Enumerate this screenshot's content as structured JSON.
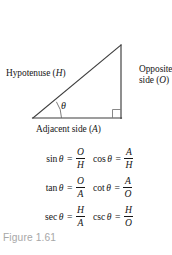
{
  "figure": {
    "caption": "Figure 1.61",
    "caption_color": "#a7a7a7",
    "background_color": "#ffffff",
    "line_color": "#3c3c3c"
  },
  "diagram": {
    "type": "right-triangle",
    "hypotenuse_label": "Hypotenuse (",
    "hypotenuse_var": "H",
    "hypotenuse_label_close": ")",
    "opposite_label": "Opposite side (",
    "opposite_var": "O",
    "opposite_label_close": ")",
    "adjacent_label": "Adjacent side (",
    "adjacent_var": "A",
    "adjacent_label_close": ")",
    "angle_symbol": "θ",
    "right_angle_marker": true,
    "vertices": {
      "left": [
        33,
        118
      ],
      "apex": [
        121,
        45
      ],
      "right": [
        121,
        118
      ]
    }
  },
  "formulas": [
    {
      "left": {
        "fn": "sin",
        "theta": "θ",
        "eq": "=",
        "numerator": "O",
        "denominator": "H"
      },
      "right": {
        "fn": "cos",
        "theta": "θ",
        "eq": "=",
        "numerator": "A",
        "denominator": "H"
      }
    },
    {
      "left": {
        "fn": "tan",
        "theta": "θ",
        "eq": "=",
        "numerator": "O",
        "denominator": "A"
      },
      "right": {
        "fn": "cot",
        "theta": "θ",
        "eq": "=",
        "numerator": "A",
        "denominator": "O"
      }
    },
    {
      "left": {
        "fn": "sec",
        "theta": "θ",
        "eq": "=",
        "numerator": "H",
        "denominator": "A"
      },
      "right": {
        "fn": "csc",
        "theta": "θ",
        "eq": "=",
        "numerator": "H",
        "denominator": "O"
      }
    }
  ]
}
